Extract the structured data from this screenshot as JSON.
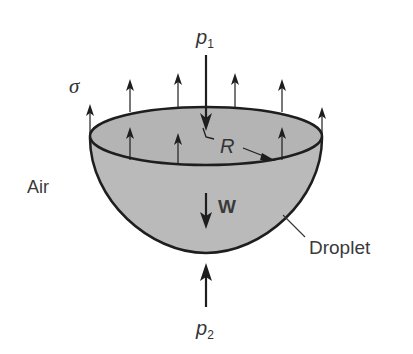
{
  "diagram": {
    "colors": {
      "droplet_fill": "#b9b9b9",
      "outline": "#1e1e1e",
      "text": "#3a3a3a",
      "background": "#ffffff"
    },
    "labels": {
      "p1": "p",
      "p1_sub": "1",
      "p2": "p",
      "p2_sub": "2",
      "sigma": "σ",
      "radius": "R",
      "weight": "W",
      "air": "Air",
      "droplet": "Droplet"
    }
  }
}
